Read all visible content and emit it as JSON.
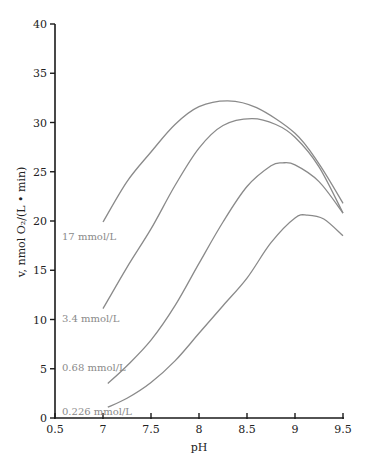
{
  "chart_data": {
    "type": "line",
    "title": "",
    "xlabel": "pH",
    "ylabel": "v, nmol O₂/(L • min)",
    "xlim": [
      6.5,
      9.5
    ],
    "ylim": [
      0,
      40
    ],
    "grid": false,
    "legend": "inline labels at left end of each curve",
    "x_ticks": [
      6.5,
      7,
      7.5,
      8,
      8.5,
      9,
      9.5
    ],
    "x_tick_labels": [
      "0.5",
      "7",
      "7.5",
      "8",
      "8.5",
      "9",
      "9.5"
    ],
    "y_ticks": [
      0,
      5,
      10,
      15,
      20,
      25,
      30,
      35,
      40
    ],
    "y_tick_labels": [
      "0",
      "5",
      "10",
      "15",
      "20",
      "25",
      "30",
      "35",
      "40"
    ],
    "series": [
      {
        "name": "17 mmol/L",
        "x": [
          7.0,
          7.25,
          7.5,
          7.75,
          8.0,
          8.3,
          8.6,
          9.0,
          9.25,
          9.5
        ],
        "values": [
          19.9,
          24.0,
          27.0,
          29.8,
          31.6,
          32.2,
          31.5,
          28.9,
          25.8,
          21.8
        ]
      },
      {
        "name": "3.4 mmol/L",
        "x": [
          7.0,
          7.25,
          7.5,
          7.75,
          8.0,
          8.25,
          8.55,
          8.8,
          9.0,
          9.25,
          9.5
        ],
        "values": [
          11.1,
          15.3,
          19.2,
          23.6,
          27.4,
          29.7,
          30.4,
          29.8,
          28.5,
          25.5,
          20.8
        ]
      },
      {
        "name": "0.68 mmol/L",
        "x": [
          7.05,
          7.25,
          7.5,
          7.75,
          8.0,
          8.25,
          8.5,
          8.75,
          8.87,
          9.0,
          9.25,
          9.5
        ],
        "values": [
          3.5,
          5.3,
          7.9,
          11.4,
          15.7,
          19.9,
          23.5,
          25.6,
          25.9,
          25.7,
          24.0,
          20.8
        ]
      },
      {
        "name": "0.226 mmol/L",
        "x": [
          7.05,
          7.25,
          7.5,
          7.75,
          8.0,
          8.25,
          8.5,
          8.75,
          9.0,
          9.13,
          9.3,
          9.5
        ],
        "values": [
          1.1,
          2.0,
          3.6,
          5.8,
          8.6,
          11.4,
          14.2,
          17.8,
          20.3,
          20.6,
          20.2,
          18.5
        ]
      }
    ]
  },
  "labels": {
    "xlabel": "pH",
    "ylabel": "v, nmol O₂/(L • min)",
    "series_17": "17 mmol/L",
    "series_3_4": "3.4 mmol/L",
    "series_0_68": "0.68 mmol/L",
    "series_0_226": "0.226 mmol/L"
  },
  "style": {
    "curve_color": "#8a8a8a",
    "axis_color": "#1a1a1a"
  }
}
